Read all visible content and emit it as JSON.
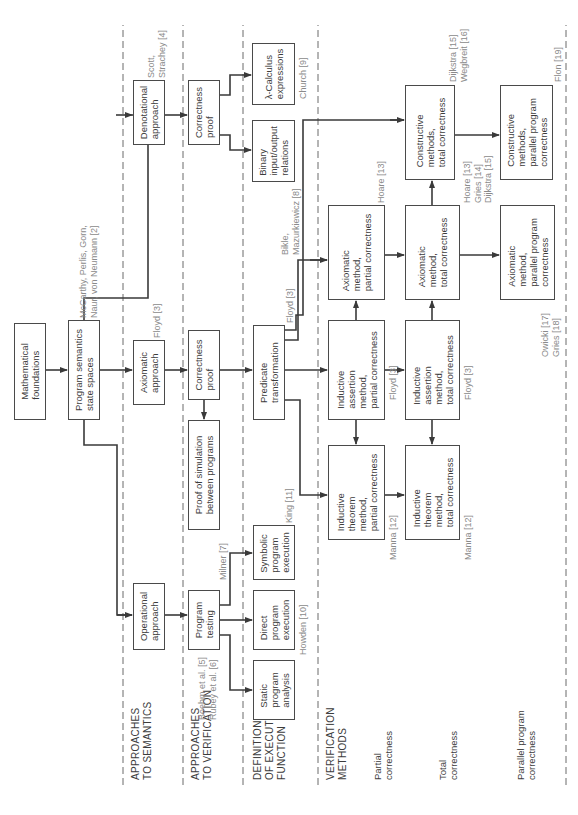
{
  "rows": {
    "semantics": "APPROACHES\nTO SEMANTICS",
    "verification": "APPROACHES\nTO VERIFICATION",
    "execution": "DEFINITION\nOF EXECUTION\nFUNCTION",
    "methods": "VERIFICATION\nMETHODS",
    "partial": "Partial\ncorrectness",
    "total": "Total\ncorrectness",
    "parallel": "Parallel program\ncorrectness"
  },
  "boxes": {
    "math": "Mathematical\nfoundations",
    "semantics": "Program semantics\nstate spaces",
    "denotational": "Denotational\napproach",
    "axiomatic_approach": "Axiomatic\napproach",
    "operational": "Operational\napproach",
    "correctness_top": "Correctness\nproof",
    "correctness_mid": "Correctness\nproof",
    "simulation": "Proof of simulation\nbetween programs",
    "testing": "Program\ntesting",
    "lambda": "λ-Calculus\nexpressions",
    "binary": "Binary\ninput/output\nrelations",
    "predicate": "Predicate\ntransformation",
    "symbolic": "Symbolic\nprogram\nexecution",
    "direct": "Direct\nprogram\nexecution",
    "static": "Static\nprogram\nanalysis",
    "ind_theorem_partial": "Inductive\ntheorem\nmethod,\npartial correctness",
    "ind_assertion_partial": "Inductive\nassertion\nmethod,\npartial correctness",
    "axiomatic_partial": "Axiomatic\nmethod,\npartial correctness",
    "ind_theorem_total": "Inductive\ntheorem\nmethod,\ntotal correctness",
    "ind_assertion_total": "Inductive\nassertion\nmethod,\ntotal correctness",
    "axiomatic_total": "Axiomatic\nmethod,\ntotal correctness",
    "constructive_total": "Constructive\nmethods,\ntotal correctness",
    "axiomatic_parallel": "Axiomatic\nmethod,\nparallel program\ncorrectness",
    "constructive_parallel": "Constructive\nmethods,\nparallel program\ncorrectness"
  },
  "refs": {
    "mccarthy": "McCarthy, Perlis, Gorn,\nNaur, von Neumann [2]",
    "scott": "Scott,\nStrachey [4]",
    "floyd_axiomatic": "Floyd [3]",
    "boehm": "Boehm et al. [5]\nRubey et al. [6]",
    "milner": "Milner [7]",
    "church": "Church [9]",
    "bikle": "Bikle,\nMazurkiewicz [8]",
    "floyd_predicate": "Floyd [3]",
    "king": "King [11]",
    "howden": "Howden [10]",
    "hoare_partial": "Hoare [13]",
    "floyd_partial": "Floyd [3]",
    "manna_partial": "Manna [12]",
    "dijkstra_wegbreit": "Dijkstra [15]\nWegbreit [16]",
    "hoare_gries_dijkstra": "Hoare [13]\nGries [14]\nDijkstra [15]",
    "floyd_total": "Floyd [3]",
    "manna_total": "Manna [12]",
    "flon": "Flon [19]",
    "owicki": "Owicki [17]\nGries [18]"
  },
  "colors": {
    "line": "#3a3a3a",
    "ref_text": "#8a8a8a",
    "dashed": "#6a6a6a"
  }
}
